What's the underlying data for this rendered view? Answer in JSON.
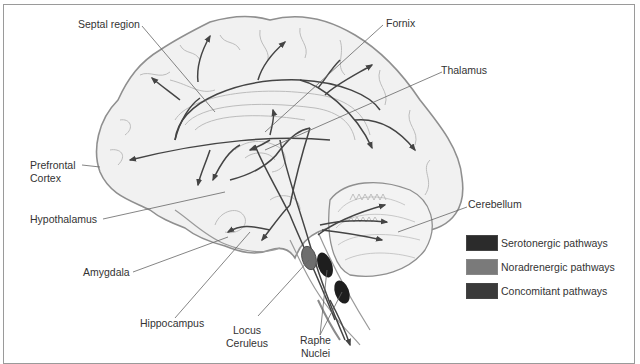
{
  "diagram": {
    "type": "anatomical-pathway-diagram"
  },
  "labels": {
    "septal_region": "Septal region",
    "fornix": "Fornix",
    "thalamus": "Thalamus",
    "prefrontal_cortex_line1": "Prefrontal",
    "prefrontal_cortex_line2": "Cortex",
    "hypothalamus": "Hypothalamus",
    "amygdala": "Amygdala",
    "hippocampus": "Hippocampus",
    "locus_ceruleus_line1": "Locus",
    "locus_ceruleus_line2": "Ceruleus",
    "raphe_nuclei_line1": "Raphe",
    "raphe_nuclei_line2": "Nuclei",
    "cerebellum": "Cerebellum"
  },
  "legend": {
    "items": [
      {
        "label": "Serotonergic pathways",
        "color": "#2b2b2b"
      },
      {
        "label": "Noradrenergic pathways",
        "color": "#7a7a7a"
      },
      {
        "label": "Concomitant pathways",
        "color": "#3a3a3a"
      }
    ]
  },
  "colors": {
    "brain_outline": "#8f8f8f",
    "brain_fill": "#f1f1f1",
    "sulci": "#b5b5b5",
    "pathway": "#444444",
    "leader_line": "#666666",
    "raphe_nucleus": "#1e1e1e",
    "locus_ceruleus": "#6e6e6e"
  }
}
